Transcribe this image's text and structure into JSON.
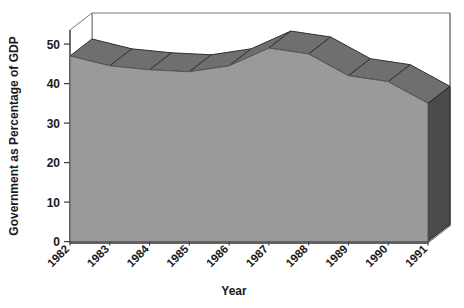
{
  "chart_data": {
    "type": "area",
    "style": "3d-area",
    "title": "",
    "xlabel": "Year",
    "ylabel": "Government as Percentage of GDP",
    "categories": [
      "1982",
      "1983",
      "1984",
      "1985",
      "1986",
      "1987",
      "1988",
      "1989",
      "1990",
      "1991"
    ],
    "values": [
      47,
      44.5,
      43.5,
      43,
      44.5,
      49,
      47.5,
      42,
      40.5,
      35
    ],
    "series": [
      {
        "name": "Government as Percentage of GDP",
        "values": [
          47,
          44.5,
          43.5,
          43,
          44.5,
          49,
          47.5,
          42,
          40.5,
          35
        ]
      }
    ],
    "ylim": [
      0,
      50
    ],
    "yticks": [
      0,
      10,
      20,
      30,
      40,
      50
    ],
    "ytick_labels": [
      "0",
      "10",
      "20",
      "30",
      "40",
      "50"
    ],
    "xlim_categories": [
      "1982",
      "1991"
    ],
    "grid": false,
    "legend": false,
    "legend_position": "none",
    "colors": {
      "area_front": "#9a9a9a",
      "area_top": "#6f6f6f",
      "area_side": "#4a4a4a",
      "floor": "#ffffff",
      "axis_line": "#555555",
      "text": "#1a1a1a",
      "background": "#ffffff"
    }
  },
  "axes": {
    "y_title": "Government as Percentage of GDP",
    "x_title": "Year",
    "y_tick_0": "0",
    "y_tick_1": "10",
    "y_tick_2": "20",
    "y_tick_3": "30",
    "y_tick_4": "40",
    "y_tick_5": "50",
    "x_tick_0": "1982",
    "x_tick_1": "1983",
    "x_tick_2": "1984",
    "x_tick_3": "1985",
    "x_tick_4": "1986",
    "x_tick_5": "1987",
    "x_tick_6": "1988",
    "x_tick_7": "1989",
    "x_tick_8": "1990",
    "x_tick_9": "1991"
  }
}
